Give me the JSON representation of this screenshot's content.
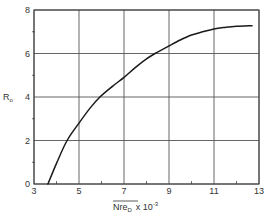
{
  "chart_data": {
    "type": "line",
    "title": "",
    "xlabel": "Nre_D x 10^-3",
    "xlabel_parts": {
      "main": "Nre",
      "sub": "D",
      "multiplier": "x 10",
      "exp": "-3"
    },
    "ylabel": "R_o",
    "ylabel_parts": {
      "main": "R",
      "sub": "o"
    },
    "xlim": [
      3,
      13
    ],
    "ylim": [
      0,
      8
    ],
    "x_ticks": [
      3,
      5,
      7,
      9,
      11,
      13
    ],
    "x_tick_labels": [
      "3",
      "5",
      "7",
      "9",
      "11",
      "13"
    ],
    "x_minor_ticks": [
      4,
      6,
      8,
      10,
      12
    ],
    "y_ticks": [
      0,
      2,
      4,
      6,
      8
    ],
    "y_tick_labels": [
      "0",
      "2",
      "4",
      "6",
      "8"
    ],
    "y_minor_ticks": [
      1,
      3,
      5,
      7
    ],
    "grid": true,
    "legend": null,
    "series": [
      {
        "name": "R_o vs Nre_D",
        "x": [
          3.62,
          4.0,
          4.47,
          5.0,
          5.5,
          5.93,
          6.5,
          7.0,
          7.5,
          8.0,
          8.38,
          9.0,
          9.5,
          10.0,
          10.5,
          11.0,
          11.5,
          12.0,
          12.69
        ],
        "y": [
          0.0,
          0.95,
          2.0,
          2.8,
          3.5,
          4.0,
          4.5,
          4.9,
          5.35,
          5.75,
          6.0,
          6.35,
          6.62,
          6.85,
          7.0,
          7.13,
          7.2,
          7.25,
          7.28
        ]
      }
    ]
  },
  "colors": {
    "line": "#1a1a1a",
    "grid": "#555555",
    "axis": "#444444",
    "background": "#ffffff"
  }
}
